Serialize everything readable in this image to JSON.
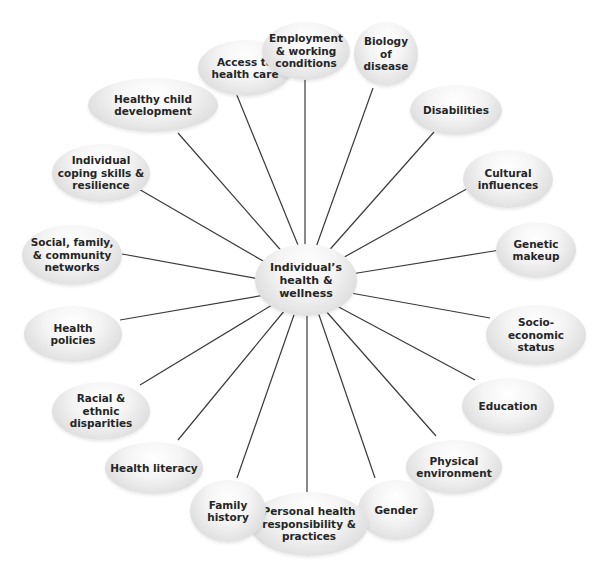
{
  "diagram": {
    "center": {
      "label": "Individual’s\nhealth &\nwellness"
    },
    "nodes": [
      {
        "id": "access",
        "label": "Access to\nhealth care"
      },
      {
        "id": "employment",
        "label": "Employment\n& working\nconditions"
      },
      {
        "id": "biology",
        "label": "Biology\nof\ndisease"
      },
      {
        "id": "disabilities",
        "label": "Disabilities"
      },
      {
        "id": "cultural",
        "label": "Cultural\ninfluences"
      },
      {
        "id": "genetic",
        "label": "Genetic\nmakeup"
      },
      {
        "id": "socioeconomic",
        "label": "Socio-\neconomic\nstatus"
      },
      {
        "id": "education",
        "label": "Education"
      },
      {
        "id": "physical",
        "label": "Physical\nenvironment"
      },
      {
        "id": "gender",
        "label": "Gender"
      },
      {
        "id": "personal",
        "label": "Personal health\nresponsibility &\npractices"
      },
      {
        "id": "family",
        "label": "Family\nhistory"
      },
      {
        "id": "literacy",
        "label": "Health literacy"
      },
      {
        "id": "racial",
        "label": "Racial &\nethnic\ndisparities"
      },
      {
        "id": "policies",
        "label": "Health\npolicies"
      },
      {
        "id": "social",
        "label": "Social, family,\n& community\nnetworks"
      },
      {
        "id": "coping",
        "label": "Individual\ncoping skills &\nresilience"
      },
      {
        "id": "child",
        "label": "Healthy child\ndevelopment"
      }
    ]
  }
}
